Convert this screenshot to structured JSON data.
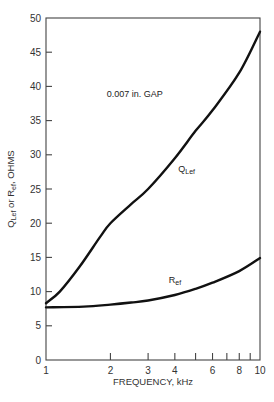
{
  "chart_data": {
    "type": "line",
    "title": "",
    "xlabel": "FREQUENCY, kHz",
    "ylabel": "Q_Lef or R_ef, OHMS",
    "ylabel_parts": {
      "q": "Q",
      "q_sub": "Lef",
      "or": " or R",
      "r_sub": "ef",
      "unit": ", OHMS"
    },
    "x_scale": "log",
    "xlim": [
      1,
      10
    ],
    "ylim": [
      0,
      50
    ],
    "grid": false,
    "x_ticks": [
      1,
      2,
      3,
      4,
      5,
      6,
      7,
      8,
      9,
      10
    ],
    "x_tick_labels": [
      {
        "value": 1,
        "label": "1"
      },
      {
        "value": 2,
        "label": "2"
      },
      {
        "value": 3,
        "label": "3"
      },
      {
        "value": 4,
        "label": "4"
      },
      {
        "value": 6,
        "label": "6"
      },
      {
        "value": 8,
        "label": "8"
      },
      {
        "value": 10,
        "label": "10"
      }
    ],
    "y_ticks": [
      0,
      5,
      10,
      15,
      20,
      25,
      30,
      35,
      40,
      45,
      50
    ],
    "y_tick_labels": [
      "0",
      "5",
      "10",
      "15",
      "20",
      "25",
      "30",
      "35",
      "40",
      "45",
      "50"
    ],
    "annotations": [
      {
        "text": "0.007 in. GAP",
        "x": 2.6,
        "y": 38.5
      }
    ],
    "series": [
      {
        "name": "Q_Lef",
        "label_main": "Q",
        "label_sub": "Lef",
        "label_at": {
          "x": 4.15,
          "y": 27.5
        },
        "x": [
          1,
          1.16,
          1.44,
          1.79,
          2,
          2.5,
          3,
          4,
          5,
          6,
          8,
          10
        ],
        "y": [
          8.3,
          10,
          13.7,
          18,
          20,
          22.8,
          25,
          29.5,
          33.5,
          36.5,
          42,
          48
        ]
      },
      {
        "name": "R_ef",
        "label_main": "R",
        "label_sub": "ef",
        "label_at": {
          "x": 3.75,
          "y": 11.3
        },
        "x": [
          1,
          1.5,
          2,
          2.5,
          3,
          4,
          5,
          6,
          8,
          10
        ],
        "y": [
          7.7,
          7.8,
          8.1,
          8.4,
          8.7,
          9.5,
          10.4,
          11.3,
          13.0,
          14.9
        ]
      }
    ]
  }
}
